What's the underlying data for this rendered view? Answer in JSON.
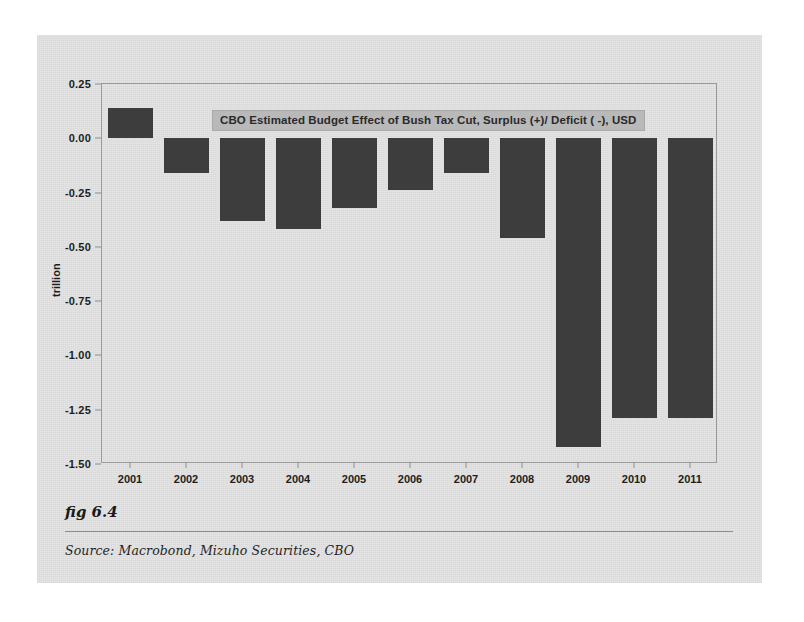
{
  "figure": {
    "fig_label": "fig 6.4",
    "source": "Source:  Macrobond, Mizuho Securities, CBO"
  },
  "chart_data": {
    "type": "bar",
    "title": "CBO Estimated Budget Effect of Bush Tax Cut, Surplus (+)/ Deficit ( -), USD",
    "xlabel": "",
    "ylabel": "trillion",
    "categories": [
      "2001",
      "2002",
      "2003",
      "2004",
      "2005",
      "2006",
      "2007",
      "2008",
      "2009",
      "2010",
      "2011"
    ],
    "values": [
      0.14,
      -0.16,
      -0.38,
      -0.42,
      -0.32,
      -0.24,
      -0.16,
      -0.46,
      -1.42,
      -1.29,
      -1.29
    ],
    "ylim": [
      -1.5,
      0.25
    ],
    "yticks": [
      0.25,
      0.0,
      -0.25,
      -0.5,
      -0.75,
      -1.0,
      -1.25,
      -1.5
    ],
    "ytick_labels": [
      "0.25",
      "0.00",
      "-0.25",
      "-0.50",
      "-0.75",
      "-1.00",
      "-1.25",
      "-1.50"
    ],
    "grid": false,
    "legend_position": "inside-top-center",
    "bar_color": "#3d3d3d",
    "plot_background": "#e3e3e3",
    "frame_color": "#9a9a9a"
  }
}
